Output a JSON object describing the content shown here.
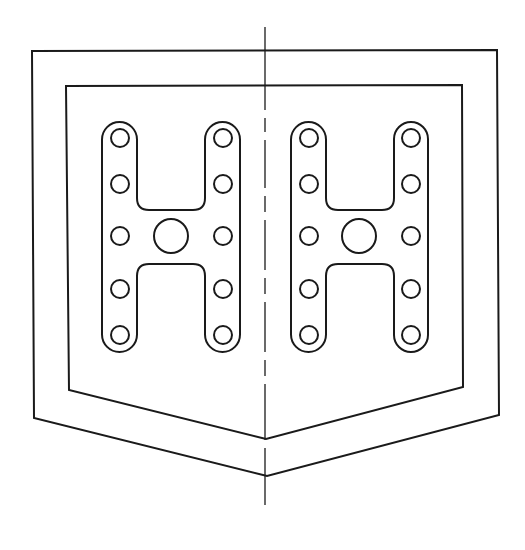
{
  "drawing": {
    "stroke_color": "#1a1a1a",
    "background": "#ffffff",
    "outer_boundary": [
      [
        32,
        51
      ],
      [
        497,
        50
      ],
      [
        499,
        415
      ],
      [
        267,
        476
      ],
      [
        34,
        418
      ]
    ],
    "inner_boundary": [
      [
        66,
        86
      ],
      [
        462,
        85
      ],
      [
        463,
        387
      ],
      [
        266,
        439
      ],
      [
        69,
        390
      ]
    ],
    "centerline": {
      "x": 265,
      "y1": 27,
      "y2": 505,
      "segments": [
        [
          27,
          110
        ],
        [
          118,
          132
        ],
        [
          140,
          188
        ],
        [
          196,
          212
        ],
        [
          220,
          270
        ],
        [
          278,
          294
        ],
        [
          302,
          352
        ],
        [
          360,
          376
        ],
        [
          384,
          440
        ],
        [
          448,
          505
        ]
      ]
    },
    "h_plates": [
      {
        "name": "left",
        "left_leg": [
          102,
          137
        ],
        "right_leg": [
          205,
          240
        ],
        "top": 122,
        "bottom": 352,
        "bar_top": 210,
        "bar_bottom": 264,
        "center_hole": {
          "cx": 171,
          "cy": 236,
          "r": 17
        },
        "holes": [
          {
            "cx": 120,
            "cy": 138
          },
          {
            "cx": 120,
            "cy": 184
          },
          {
            "cx": 120,
            "cy": 236
          },
          {
            "cx": 120,
            "cy": 289
          },
          {
            "cx": 120,
            "cy": 335
          },
          {
            "cx": 223,
            "cy": 138
          },
          {
            "cx": 223,
            "cy": 184
          },
          {
            "cx": 223,
            "cy": 236
          },
          {
            "cx": 223,
            "cy": 289
          },
          {
            "cx": 223,
            "cy": 335
          }
        ]
      },
      {
        "name": "right",
        "left_leg": [
          291,
          326
        ],
        "right_leg": [
          394,
          428
        ],
        "top": 122,
        "bottom": 352,
        "bar_top": 210,
        "bar_bottom": 264,
        "center_hole": {
          "cx": 359,
          "cy": 236,
          "r": 17
        },
        "holes": [
          {
            "cx": 309,
            "cy": 138
          },
          {
            "cx": 309,
            "cy": 184
          },
          {
            "cx": 309,
            "cy": 236
          },
          {
            "cx": 309,
            "cy": 289
          },
          {
            "cx": 309,
            "cy": 335
          },
          {
            "cx": 411,
            "cy": 138
          },
          {
            "cx": 411,
            "cy": 184
          },
          {
            "cx": 411,
            "cy": 236
          },
          {
            "cx": 411,
            "cy": 289
          },
          {
            "cx": 411,
            "cy": 335
          }
        ]
      }
    ],
    "small_hole_radius": 9
  }
}
